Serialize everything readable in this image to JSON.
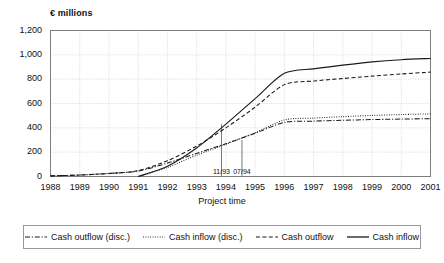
{
  "chart_data": {
    "type": "line",
    "title": "",
    "unit_label": "€ millions",
    "xlabel": "Project time",
    "ylabel": "",
    "ylim": [
      0,
      1200
    ],
    "yticks": [
      0,
      200,
      400,
      600,
      800,
      1000,
      1200
    ],
    "ytick_labels": [
      "0",
      "200",
      "400",
      "600",
      "800",
      "1,000",
      "1,200"
    ],
    "categories": [
      1988,
      1989,
      1990,
      1991,
      1992,
      1993,
      1994,
      1995,
      1996,
      1997,
      1998,
      1999,
      2000,
      2001
    ],
    "xtick_labels": [
      "1988",
      "1989",
      "1990",
      "1991",
      "1992",
      "1993",
      "1994",
      "1995",
      "1996",
      "1997",
      "1998",
      "1999",
      "2000",
      "2001"
    ],
    "grid": true,
    "legend_position": "bottom",
    "series": [
      {
        "name": "Cash outflow (disc.)",
        "style": "dash-dot",
        "color": "#1a1a1a",
        "x": [
          1988,
          1989,
          1990,
          1991,
          1992,
          1993,
          1994,
          1995,
          1996,
          1997,
          1998,
          1999,
          2000,
          2001
        ],
        "values": [
          5,
          12,
          25,
          45,
          110,
          190,
          270,
          355,
          445,
          455,
          462,
          468,
          472,
          475
        ]
      },
      {
        "name": "Cash inflow (disc.)",
        "style": "dotted",
        "color": "#1a1a1a",
        "x": [
          1991,
          1992,
          1993,
          1994,
          1995,
          1996,
          1997,
          1998,
          1999,
          2000,
          2001
        ],
        "values": [
          0,
          75,
          175,
          265,
          360,
          465,
          480,
          492,
          502,
          509,
          515
        ]
      },
      {
        "name": "Cash outflow",
        "style": "dashed",
        "color": "#1a1a1a",
        "x": [
          1988,
          1989,
          1990,
          1991,
          1992,
          1993,
          1994,
          1995,
          1996,
          1997,
          1998,
          1999,
          2000,
          2001
        ],
        "values": [
          5,
          12,
          25,
          48,
          130,
          250,
          400,
          570,
          755,
          785,
          805,
          825,
          843,
          858
        ]
      },
      {
        "name": "Cash inflow",
        "style": "solid",
        "color": "#1a1a1a",
        "x": [
          1991,
          1992,
          1993,
          1994,
          1995,
          1996,
          1997,
          1998,
          1999,
          2000,
          2001
        ],
        "values": [
          0,
          85,
          235,
          430,
          640,
          848,
          885,
          915,
          942,
          960,
          970
        ]
      }
    ],
    "annotations": [
      {
        "label": "11/93",
        "x": 1993.85,
        "y_top": 430
      },
      {
        "label": "07/94",
        "x": 1994.55,
        "y_top": 300
      }
    ]
  },
  "legend": {
    "items": [
      {
        "label": "Cash outflow (disc.)",
        "style": "dash-dot"
      },
      {
        "label": "Cash inflow (disc.)",
        "style": "dotted"
      },
      {
        "label": "Cash outflow",
        "style": "dashed"
      },
      {
        "label": "Cash inflow",
        "style": "solid"
      }
    ]
  }
}
